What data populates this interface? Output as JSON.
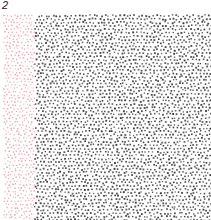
{
  "figure": {
    "panel_label": "2",
    "field": {
      "x0": 3,
      "y0": 14,
      "x1": 211,
      "y1": 220
    },
    "regions": [
      {
        "name": "red-dot-strip",
        "x0": 3,
        "x1": 34,
        "color": "#e79aa6",
        "dot_size": 1.3,
        "spacing": 3.6
      },
      {
        "name": "black-dot-field",
        "x0": 34,
        "x1": 211,
        "color": "#3a3a3a",
        "dot_size": 1.6,
        "spacing": 3.7
      }
    ],
    "background": "#ffffff"
  }
}
